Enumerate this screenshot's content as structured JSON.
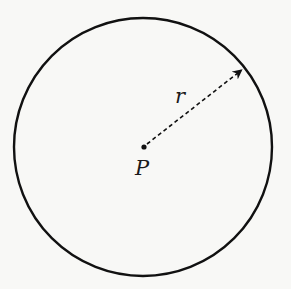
{
  "diagram": {
    "type": "circle-with-radius",
    "colors": {
      "stroke": "#111111",
      "background": "#f8f8f6"
    },
    "circle": {
      "cx": 143,
      "cy": 147,
      "r": 129,
      "stroke_width": 2.4
    },
    "center_point": {
      "x": 144,
      "y": 147,
      "label": "P"
    },
    "radius_arrow": {
      "from": [
        144,
        147
      ],
      "to": [
        243,
        69
      ],
      "style": "dashed",
      "label": "r"
    }
  }
}
